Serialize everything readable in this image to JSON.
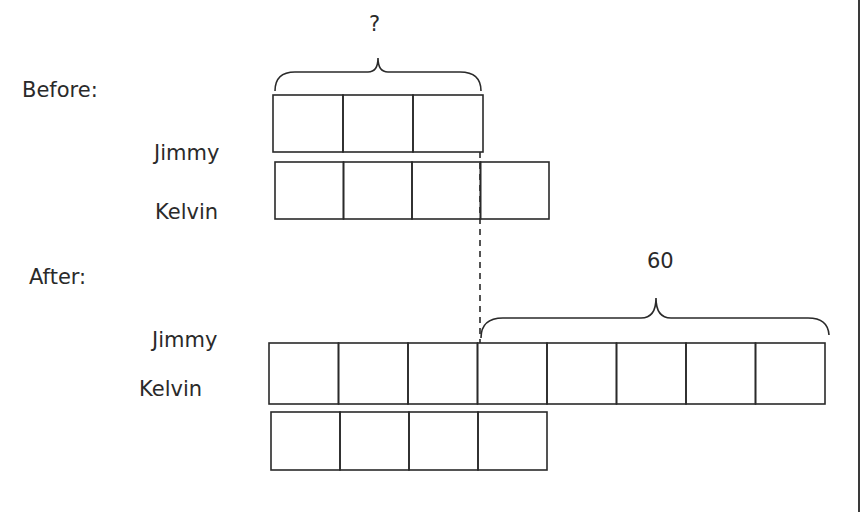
{
  "labels": {
    "before": "Before:",
    "after": "After:",
    "before_jimmy": "Jimmy",
    "before_kelvin": "Kelvin",
    "after_jimmy": "Jimmy",
    "after_kelvin": "Kelvin"
  },
  "annotations": {
    "unknown": "?",
    "sixty": "60"
  },
  "colors": {
    "stroke": "#2a2a2a",
    "text": "#2a2a2a",
    "background": "#ffffff"
  },
  "bars": {
    "before_jimmy": {
      "x": 273,
      "y": 95,
      "unit_w": 70,
      "h": 57,
      "units": 3
    },
    "before_kelvin": {
      "x": 275,
      "y": 162,
      "unit_w": 68.5,
      "h": 57,
      "units": 4
    },
    "after_jimmy": {
      "x": 269,
      "y": 343,
      "unit_w": 69.5,
      "h": 61,
      "units": 8
    },
    "after_kelvin": {
      "x": 271,
      "y": 412,
      "unit_w": 69,
      "h": 58,
      "units": 4
    }
  }
}
